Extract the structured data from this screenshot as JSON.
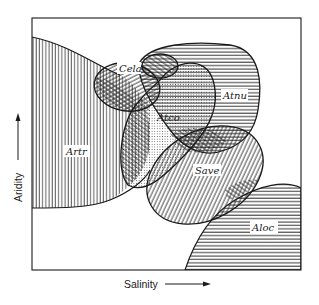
{
  "diagram": {
    "type": "species-niche-overlap",
    "x_axis_label": "Salinity",
    "y_axis_label": "Aridity",
    "colors": {
      "ink": "#1a1a1a",
      "background": "#ffffff"
    },
    "regions": [
      {
        "id": "artr",
        "label": "Artr",
        "pattern": "vertical-lines"
      },
      {
        "id": "cela",
        "label": "Cela",
        "pattern": "diagonal-lines"
      },
      {
        "id": "atco",
        "label": "Atco",
        "pattern": "dots"
      },
      {
        "id": "atnu",
        "label": "Atnu",
        "pattern": "horizontal-lines"
      },
      {
        "id": "save",
        "label": "Save",
        "pattern": "diagonal-lines"
      },
      {
        "id": "aloc",
        "label": "Aloc",
        "pattern": "horizontal-lines"
      }
    ]
  }
}
